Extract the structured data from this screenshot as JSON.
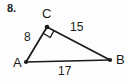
{
  "problem": {
    "number": "8."
  },
  "figure": {
    "type": "right-triangle",
    "stroke_color": "#1a1a1a",
    "background_color": "#fdfdfd",
    "vertices": [
      {
        "name": "A",
        "label": "A",
        "x": 26,
        "y": 62
      },
      {
        "name": "B",
        "label": "B",
        "x": 110,
        "y": 60
      },
      {
        "name": "C",
        "label": "C",
        "x": 47,
        "y": 26
      }
    ],
    "sides": [
      {
        "name": "AC",
        "label": "8",
        "from": "A",
        "to": "C"
      },
      {
        "name": "CB",
        "label": "15",
        "from": "C",
        "to": "B"
      },
      {
        "name": "AB",
        "label": "17",
        "from": "A",
        "to": "B"
      }
    ],
    "right_angle": {
      "at_vertex": "C",
      "marker": "square"
    }
  }
}
